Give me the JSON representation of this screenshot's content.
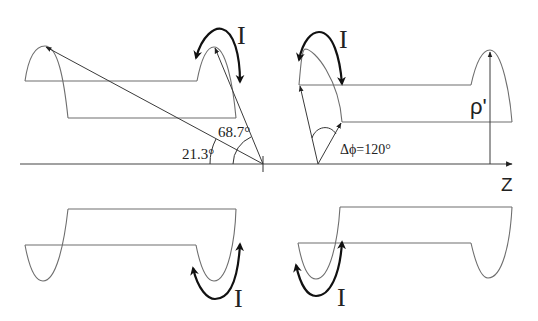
{
  "diagram": {
    "axis": {
      "label": "Z"
    },
    "current_label": "I",
    "angles": {
      "alpha_label": "21.3°",
      "beta_label": "68.7°",
      "delta_phi_label": "Δϕ=120°"
    },
    "radius_label": "ρ'",
    "colors": {
      "wire": "#6e6e6e",
      "current_arrow": "#111111",
      "vector": "#3a3a3a",
      "background": "#ffffff"
    }
  }
}
